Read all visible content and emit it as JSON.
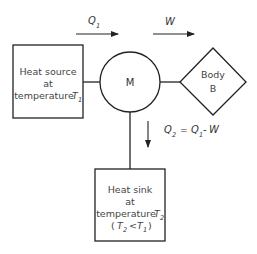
{
  "diagram": {
    "type": "heat-engine-schematic",
    "nodes": {
      "source": {
        "lines": [
          "Heat source",
          "at",
          "temperature"
        ],
        "var": "T",
        "sub": "1"
      },
      "engine": {
        "label": "M"
      },
      "body": {
        "lines": [
          "Body",
          "B"
        ]
      },
      "sink": {
        "lines": [
          "Heat sink",
          "at",
          "temperature"
        ],
        "var": "T",
        "sub": "2",
        "condition": {
          "open": "(",
          "lhs_var": "T",
          "lhs_sub": "2",
          "op": "<",
          "rhs_var": "T",
          "rhs_sub": "1",
          "close": ")"
        }
      }
    },
    "flows": {
      "q1": {
        "var": "Q",
        "sub": "1"
      },
      "w": {
        "var": "W"
      },
      "q2": {
        "var": "Q",
        "sub": "2",
        "eq": "=",
        "rhs_var": "Q",
        "rhs_sub": "1",
        "minus": "-",
        "rhs_w": "W"
      }
    },
    "colors": {
      "stroke": "#222222",
      "text": "#444444",
      "background": "#ffffff"
    }
  }
}
